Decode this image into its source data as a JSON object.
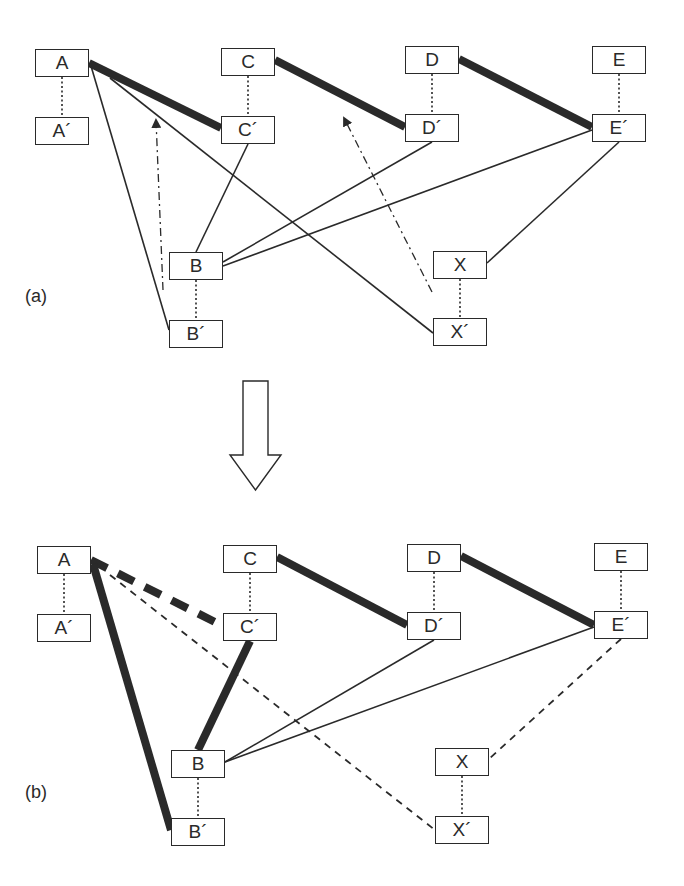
{
  "panels": [
    {
      "id": "a",
      "label": "(a)",
      "label_pos": [
        25,
        286
      ],
      "nodes": [
        {
          "id": "A",
          "label": "A",
          "x": 35,
          "y": 49,
          "w": 54,
          "h": 28
        },
        {
          "id": "A'",
          "label": "A´",
          "x": 35,
          "y": 117,
          "w": 54,
          "h": 28
        },
        {
          "id": "C",
          "label": "C",
          "x": 221,
          "y": 48,
          "w": 54,
          "h": 28
        },
        {
          "id": "C'",
          "label": "C´",
          "x": 221,
          "y": 116,
          "w": 54,
          "h": 28
        },
        {
          "id": "D",
          "label": "D",
          "x": 405,
          "y": 46,
          "w": 54,
          "h": 28
        },
        {
          "id": "D'",
          "label": "D´",
          "x": 405,
          "y": 114,
          "w": 54,
          "h": 28
        },
        {
          "id": "E",
          "label": "E",
          "x": 592,
          "y": 46,
          "w": 54,
          "h": 28
        },
        {
          "id": "E'",
          "label": "E´",
          "x": 592,
          "y": 114,
          "w": 54,
          "h": 28
        },
        {
          "id": "B",
          "label": "B",
          "x": 169,
          "y": 252,
          "w": 54,
          "h": 28
        },
        {
          "id": "B'",
          "label": "B´",
          "x": 169,
          "y": 320,
          "w": 54,
          "h": 28
        },
        {
          "id": "X",
          "label": "X",
          "x": 433,
          "y": 251,
          "w": 54,
          "h": 28
        },
        {
          "id": "X'",
          "label": "X´",
          "x": 433,
          "y": 318,
          "w": 54,
          "h": 28
        }
      ],
      "edges": [
        {
          "from": [
            62,
            77
          ],
          "to": [
            62,
            117
          ],
          "style": "dotted"
        },
        {
          "from": [
            248,
            76
          ],
          "to": [
            248,
            116
          ],
          "style": "dotted"
        },
        {
          "from": [
            432,
            74
          ],
          "to": [
            432,
            114
          ],
          "style": "dotted"
        },
        {
          "from": [
            619,
            74
          ],
          "to": [
            619,
            114
          ],
          "style": "dotted"
        },
        {
          "from": [
            196,
            280
          ],
          "to": [
            196,
            320
          ],
          "style": "dotted"
        },
        {
          "from": [
            460,
            279
          ],
          "to": [
            460,
            318
          ],
          "style": "dotted"
        },
        {
          "from": [
            89,
            63
          ],
          "to": [
            221,
            128
          ],
          "style": "thick"
        },
        {
          "from": [
            275,
            60
          ],
          "to": [
            405,
            127
          ],
          "style": "thick"
        },
        {
          "from": [
            459,
            59
          ],
          "to": [
            592,
            127
          ],
          "style": "thick"
        },
        {
          "from": [
            91,
            66
          ],
          "to": [
            169,
            330
          ],
          "style": "thin"
        },
        {
          "from": [
            110,
            78
          ],
          "to": [
            433,
            333
          ],
          "style": "thin"
        },
        {
          "from": [
            248,
            144
          ],
          "to": [
            196,
            252
          ],
          "style": "thin"
        },
        {
          "from": [
            432,
            142
          ],
          "to": [
            223,
            262
          ],
          "style": "thin"
        },
        {
          "from": [
            592,
            130
          ],
          "to": [
            223,
            266
          ],
          "style": "thin"
        },
        {
          "from": [
            619,
            142
          ],
          "to": [
            487,
            263
          ],
          "style": "thin"
        }
      ],
      "arrows": [
        {
          "from": [
            163,
            290
          ],
          "to": [
            156,
            120
          ],
          "style": "dashdot"
        },
        {
          "from": [
            432,
            292
          ],
          "to": [
            344,
            118
          ],
          "style": "dashdot"
        }
      ]
    },
    {
      "id": "b",
      "label": "(b)",
      "label_pos": [
        25,
        782
      ],
      "nodes": [
        {
          "id": "A",
          "label": "A",
          "x": 37,
          "y": 546,
          "w": 54,
          "h": 28
        },
        {
          "id": "A'",
          "label": "A´",
          "x": 37,
          "y": 614,
          "w": 54,
          "h": 28
        },
        {
          "id": "C",
          "label": "C",
          "x": 223,
          "y": 545,
          "w": 54,
          "h": 28
        },
        {
          "id": "C'",
          "label": "C´",
          "x": 223,
          "y": 613,
          "w": 54,
          "h": 28
        },
        {
          "id": "D",
          "label": "D",
          "x": 407,
          "y": 544,
          "w": 54,
          "h": 28
        },
        {
          "id": "D'",
          "label": "D´",
          "x": 407,
          "y": 612,
          "w": 54,
          "h": 28
        },
        {
          "id": "E",
          "label": "E",
          "x": 594,
          "y": 543,
          "w": 54,
          "h": 28
        },
        {
          "id": "E'",
          "label": "E´",
          "x": 594,
          "y": 611,
          "w": 54,
          "h": 28
        },
        {
          "id": "B",
          "label": "B",
          "x": 171,
          "y": 750,
          "w": 54,
          "h": 28
        },
        {
          "id": "B'",
          "label": "B´",
          "x": 171,
          "y": 818,
          "w": 54,
          "h": 28
        },
        {
          "id": "X",
          "label": "X",
          "x": 435,
          "y": 748,
          "w": 54,
          "h": 28
        },
        {
          "id": "X'",
          "label": "X´",
          "x": 435,
          "y": 816,
          "w": 54,
          "h": 28
        }
      ],
      "edges": [
        {
          "from": [
            64,
            574
          ],
          "to": [
            64,
            614
          ],
          "style": "dotted"
        },
        {
          "from": [
            250,
            573
          ],
          "to": [
            250,
            613
          ],
          "style": "dotted"
        },
        {
          "from": [
            434,
            572
          ],
          "to": [
            434,
            612
          ],
          "style": "dotted"
        },
        {
          "from": [
            621,
            571
          ],
          "to": [
            621,
            611
          ],
          "style": "dotted"
        },
        {
          "from": [
            198,
            778
          ],
          "to": [
            198,
            818
          ],
          "style": "dotted"
        },
        {
          "from": [
            462,
            776
          ],
          "to": [
            462,
            816
          ],
          "style": "dotted"
        },
        {
          "from": [
            277,
            557
          ],
          "to": [
            407,
            625
          ],
          "style": "thick"
        },
        {
          "from": [
            461,
            556
          ],
          "to": [
            594,
            625
          ],
          "style": "thick"
        },
        {
          "from": [
            91,
            560
          ],
          "to": [
            223,
            626
          ],
          "style": "thick-dashed"
        },
        {
          "from": [
            93,
            564
          ],
          "to": [
            171,
            830
          ],
          "style": "thick"
        },
        {
          "from": [
            250,
            641
          ],
          "to": [
            198,
            750
          ],
          "style": "thick"
        },
        {
          "from": [
            110,
            575
          ],
          "to": [
            435,
            830
          ],
          "style": "dashed"
        },
        {
          "from": [
            621,
            639
          ],
          "to": [
            489,
            759
          ],
          "style": "dashed"
        },
        {
          "from": [
            434,
            640
          ],
          "to": [
            225,
            762
          ],
          "style": "thin"
        },
        {
          "from": [
            594,
            627
          ],
          "to": [
            225,
            762
          ],
          "style": "thin"
        }
      ],
      "arrows": []
    }
  ],
  "transition_arrow": {
    "shaft": {
      "x": 243,
      "y": 381,
      "w": 25,
      "h": 74
    },
    "head": {
      "left": 230,
      "right": 281,
      "top": 455,
      "tip": 490
    },
    "direction": "down"
  },
  "colors": {
    "ink": "#2a2a2a",
    "background": "#ffffff"
  }
}
